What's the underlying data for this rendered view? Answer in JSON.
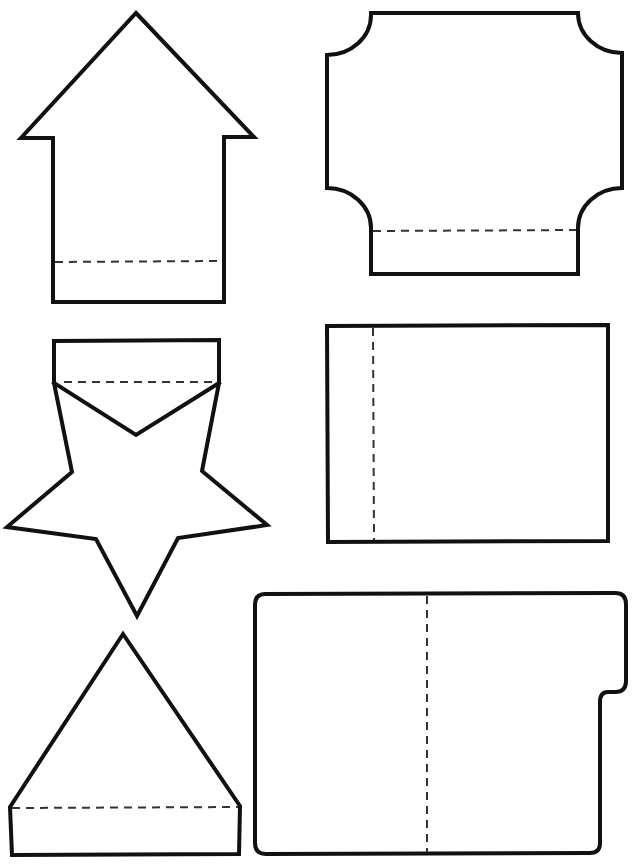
{
  "page": {
    "background": "#ffffff",
    "stroke_color": "#111111",
    "fold_line_style": "dashed"
  },
  "shapes": [
    {
      "id": "house",
      "label": "House shape",
      "has_fold_line": true,
      "fold_orientation": "horizontal"
    },
    {
      "id": "scalloped-rectangle",
      "label": "Scalloped corner rectangle",
      "has_fold_line": true,
      "fold_orientation": "horizontal"
    },
    {
      "id": "star",
      "label": "Star with tab",
      "has_fold_line": true,
      "fold_orientation": "horizontal"
    },
    {
      "id": "rectangle",
      "label": "Rectangle",
      "has_fold_line": true,
      "fold_orientation": "vertical"
    },
    {
      "id": "triangle",
      "label": "Triangle with tab",
      "has_fold_line": true,
      "fold_orientation": "horizontal"
    },
    {
      "id": "folder",
      "label": "Folder with tab",
      "has_fold_line": true,
      "fold_orientation": "vertical"
    }
  ]
}
